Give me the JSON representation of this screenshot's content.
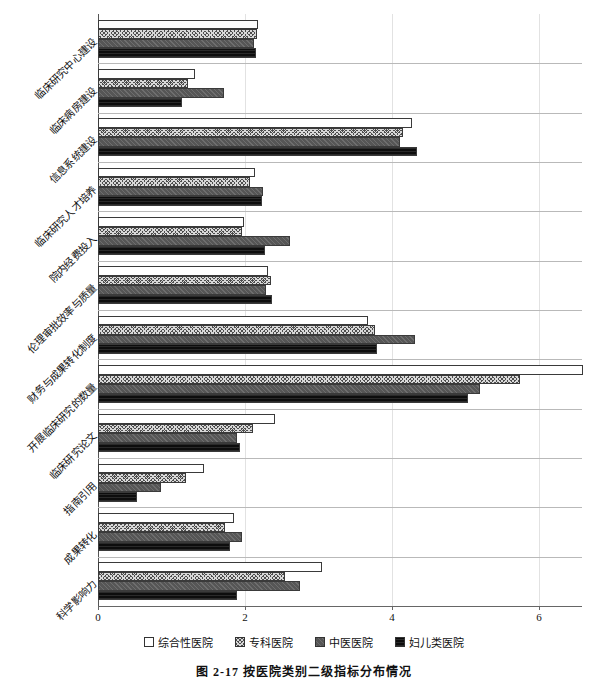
{
  "caption": "图 2-17   按医院类别二级指标分布情况",
  "legend": {
    "position": "bottom",
    "items": [
      {
        "label": "综合性医院",
        "swatch": "dotted-grid-white"
      },
      {
        "label": "专科医院",
        "swatch": "cross-hatch-dark"
      },
      {
        "label": "中医医院",
        "swatch": "diagonal-gray"
      },
      {
        "label": "妇儿类医院",
        "swatch": "solid-black"
      }
    ]
  },
  "axis": {
    "ticks": [
      "0",
      "2",
      "4",
      "6"
    ],
    "tick_values": [
      0,
      2,
      4,
      6
    ]
  },
  "chart_data": {
    "type": "bar",
    "orientation": "horizontal",
    "title": "图 2-17 按医院类别二级指标分布情况",
    "xlabel": "",
    "ylabel": "",
    "xlim": [
      0,
      6.6
    ],
    "grid": true,
    "legend_position": "bottom",
    "categories": [
      "临床研究中心建设",
      "临床病房建设",
      "信息系统建设",
      "临床研究人才培养",
      "院内经费投入",
      "伦理审批效率与质量",
      "财务与成果转化制度",
      "开展临床研究的数量",
      "临床研究论文",
      "指南引用",
      "成果转化",
      "科学影响力"
    ],
    "series": [
      {
        "name": "综合性医院",
        "values": [
          2.18,
          1.32,
          4.27,
          2.14,
          1.99,
          2.31,
          3.67,
          6.6,
          2.41,
          1.44,
          1.85,
          3.05
        ]
      },
      {
        "name": "专科医院",
        "values": [
          2.16,
          1.22,
          4.15,
          2.07,
          1.96,
          2.35,
          3.77,
          5.74,
          2.11,
          1.2,
          1.73,
          2.54
        ]
      },
      {
        "name": "中医医院",
        "values": [
          2.12,
          1.71,
          4.11,
          2.25,
          2.61,
          2.28,
          4.31,
          5.2,
          1.89,
          0.86,
          1.96,
          2.75
        ]
      },
      {
        "name": "妇儿类医院",
        "values": [
          2.15,
          1.14,
          4.34,
          2.23,
          2.27,
          2.37,
          3.8,
          5.03,
          1.93,
          0.53,
          1.8,
          1.89
        ]
      }
    ]
  }
}
